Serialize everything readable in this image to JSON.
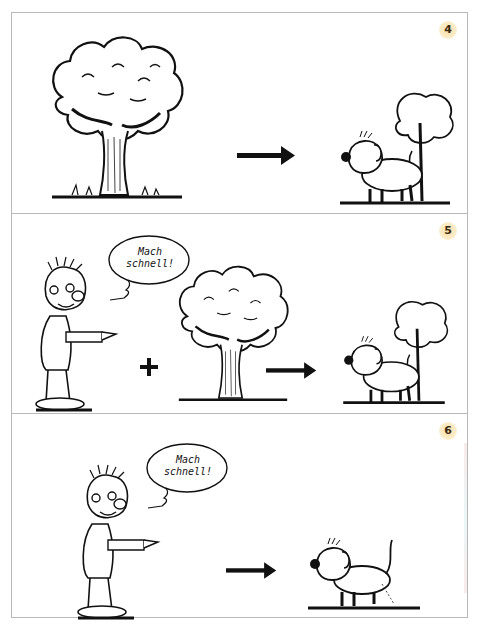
{
  "panels": [
    {
      "number": "4",
      "elements": [
        "tree",
        "arrow",
        "dog-at-tree"
      ],
      "operator": null
    },
    {
      "number": "5",
      "speech_bubble": {
        "line1": "Mach",
        "line2": "schnell!"
      },
      "elements": [
        "person-pointing",
        "plus",
        "tree",
        "arrow",
        "dog-at-tree"
      ],
      "operator": "+"
    },
    {
      "number": "6",
      "speech_bubble": {
        "line1": "Mach",
        "line2": "schnell!"
      },
      "elements": [
        "person-pointing",
        "arrow",
        "dog-peeing"
      ],
      "operator": null
    }
  ],
  "colors": {
    "frame_border": "#b9b9b9",
    "badge_fill": "#f7dfa8",
    "ink": "#111111"
  }
}
